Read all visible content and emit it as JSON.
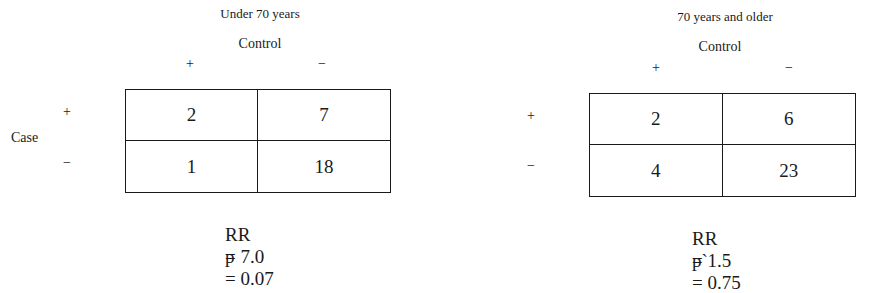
{
  "row_label": "Case",
  "panels": [
    {
      "title": "Under 70 years",
      "column_label": "Control",
      "column_signs": [
        "+",
        "−"
      ],
      "row_signs": [
        "+",
        "−"
      ],
      "cells": [
        [
          "2",
          "7"
        ],
        [
          "1",
          "18"
        ]
      ],
      "stats": [
        {
          "label": "RR",
          "value": "= 7.0"
        },
        {
          "label": "p",
          "value": "= 0.07"
        }
      ]
    },
    {
      "title": "70 years and older",
      "column_label": "Control",
      "column_signs": [
        "+",
        "−"
      ],
      "row_signs": [
        "+",
        "−"
      ],
      "cells": [
        [
          "2",
          "6"
        ],
        [
          "4",
          "23"
        ]
      ],
      "stats": [
        {
          "label": "RR",
          "value": "= 1.5"
        },
        {
          "label": "p`",
          "value": "= 0.75"
        }
      ]
    }
  ]
}
